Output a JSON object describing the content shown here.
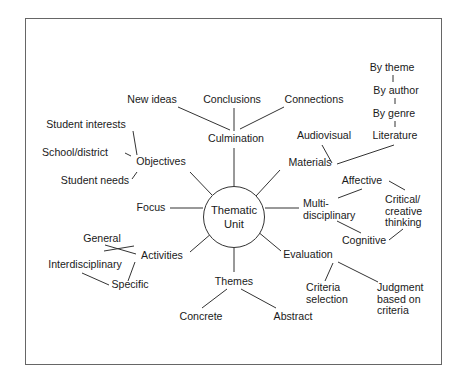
{
  "diagram": {
    "type": "concept-map",
    "center": {
      "line1": "Thematic",
      "line2": "Unit"
    },
    "nodes": {
      "culmination": "Culmination",
      "new_ideas": "New ideas",
      "conclusions": "Conclusions",
      "connections": "Connections",
      "objectives": "Objectives",
      "student_interests": "Student interests",
      "school_district": "School/district",
      "student_needs": "Student needs",
      "focus": "Focus",
      "activities": "Activities",
      "general": "General",
      "interdisciplinary": "Interdisciplinary",
      "specific": "Specific",
      "themes": "Themes",
      "concrete": "Concrete",
      "abstract": "Abstract",
      "materials": "Materials",
      "audiovisual": "Audiovisual",
      "literature": "Literature",
      "by_genre": "By genre",
      "by_author": "By author",
      "by_theme": "By theme",
      "multidisciplinary": {
        "line1": "Multi-",
        "line2": "disciplinary"
      },
      "affective": "Affective",
      "critical_creative": {
        "line1": "Critical/",
        "line2": "creative",
        "line3": "thinking"
      },
      "cognitive": "Cognitive",
      "evaluation": "Evaluation",
      "criteria_selection": {
        "line1": "Criteria",
        "line2": "selection"
      },
      "judgment": {
        "line1": "Judgment",
        "line2": "based on",
        "line3": "criteria"
      }
    },
    "colors": {
      "line": "#333333",
      "frame": "#666666",
      "text": "#1a1a1a"
    }
  }
}
